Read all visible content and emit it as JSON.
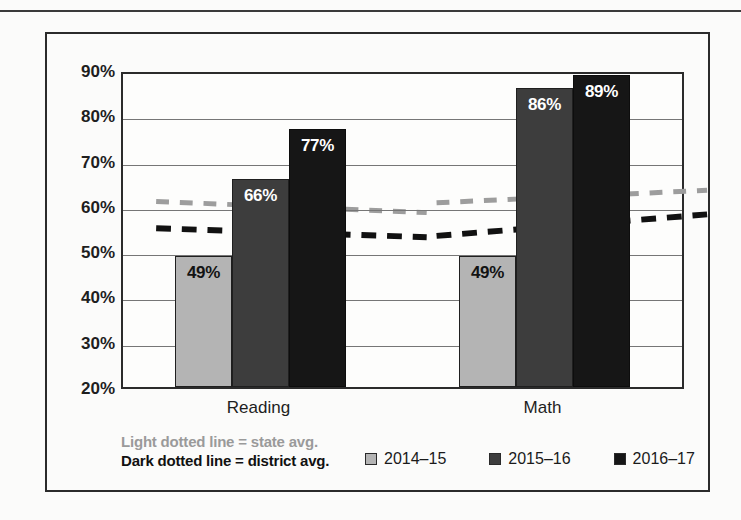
{
  "chart_data": {
    "type": "bar",
    "title": "",
    "xlabel": "",
    "ylabel": "",
    "ylim": [
      20,
      90
    ],
    "ytick_labels": [
      "90%",
      "80%",
      "70%",
      "60%",
      "50%",
      "40%",
      "30%",
      "20%"
    ],
    "ytick_values": [
      90,
      80,
      70,
      60,
      50,
      40,
      30,
      20
    ],
    "grid": true,
    "categories": [
      "Reading",
      "Math"
    ],
    "series": [
      {
        "name": "2014–15",
        "color": "#b4b4b4",
        "values": [
          49,
          49
        ],
        "labels": [
          "49%",
          "49%"
        ]
      },
      {
        "name": "2015–16",
        "color": "#3d3d3d",
        "values": [
          66,
          86
        ],
        "labels": [
          "66%",
          "86%"
        ]
      },
      {
        "name": "2016–17",
        "color": "#161616",
        "values": [
          77,
          89
        ],
        "labels": [
          "77%",
          "89%"
        ]
      }
    ],
    "trend_lines": [
      {
        "name": "state avg.",
        "style": "light dotted",
        "color": "#9d9d9d",
        "segments": [
          {
            "category": "Reading",
            "start": 61.5,
            "end": 59.0
          },
          {
            "category": "Math",
            "start": 61.2,
            "end": 64.0
          }
        ]
      },
      {
        "name": "district avg.",
        "style": "dark dotted",
        "color": "#111111",
        "segments": [
          {
            "category": "Reading",
            "start": 55.5,
            "end": 53.5
          },
          {
            "category": "Math",
            "start": 53.8,
            "end": 58.6
          }
        ]
      }
    ],
    "legend_position": "bottom-right",
    "notes": [
      "Light dotted line = state avg.",
      "Dark dotted line = district avg."
    ]
  },
  "notes": {
    "light_line": "Light dotted line = state avg.",
    "dark_line": "Dark dotted line = district avg."
  },
  "legend": {
    "items": [
      {
        "label": "2014–15",
        "color": "#b4b4b4"
      },
      {
        "label": "2015–16",
        "color": "#3d3d3d"
      },
      {
        "label": "2016–17",
        "color": "#161616"
      }
    ]
  }
}
